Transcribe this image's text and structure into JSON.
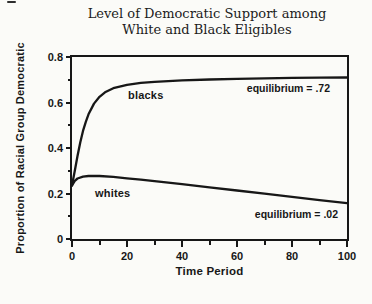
{
  "title": {
    "line1": "Level of Democratic Support among",
    "line2": "White and Black Eligibles"
  },
  "colors": {
    "curve": "#171717",
    "axis": "#171717",
    "background": "#fbfbf8",
    "text": "#171717"
  },
  "chart_data": {
    "type": "line",
    "title": "Level of Democratic Support among White and Black Eligibles",
    "xlabel": "Time Period",
    "ylabel": "Proportion of Racial Group Democratic",
    "xlim": [
      0,
      100
    ],
    "ylim": [
      0,
      0.8
    ],
    "xticks": [
      0,
      20,
      40,
      60,
      80,
      100
    ],
    "xtick_labels": [
      "0",
      "20",
      "40",
      "60",
      "80",
      "100"
    ],
    "xticks_minor": [
      10,
      30,
      50,
      70,
      90
    ],
    "yticks": [
      0,
      0.2,
      0.4,
      0.6,
      0.8
    ],
    "ytick_labels": [
      "0",
      "0.2",
      "0.4",
      "0.6",
      "0.8"
    ],
    "yticks_minor": [
      0.1,
      0.3,
      0.5,
      0.7
    ],
    "grid": false,
    "legend_position": "none",
    "series": [
      {
        "name": "blacks",
        "equilibrium": 0.72,
        "x": [
          0,
          1,
          2,
          3,
          4,
          5,
          6,
          8,
          10,
          12,
          15,
          20,
          25,
          30,
          40,
          50,
          60,
          70,
          80,
          90,
          100
        ],
        "y": [
          0.235,
          0.3,
          0.365,
          0.425,
          0.475,
          0.515,
          0.548,
          0.595,
          0.625,
          0.645,
          0.663,
          0.678,
          0.686,
          0.691,
          0.697,
          0.701,
          0.704,
          0.706,
          0.708,
          0.709,
          0.71
        ]
      },
      {
        "name": "whites",
        "equilibrium": 0.02,
        "x": [
          0,
          1,
          2,
          4,
          6,
          8,
          10,
          15,
          20,
          25,
          30,
          40,
          50,
          60,
          70,
          80,
          90,
          100
        ],
        "y": [
          0.235,
          0.256,
          0.266,
          0.274,
          0.277,
          0.278,
          0.277,
          0.273,
          0.267,
          0.261,
          0.254,
          0.241,
          0.227,
          0.213,
          0.199,
          0.185,
          0.171,
          0.158
        ]
      }
    ],
    "annotations": [
      {
        "text": "blacks",
        "x": 22,
        "y": 0.6
      },
      {
        "text": "whites",
        "x": 10,
        "y": 0.21
      },
      {
        "text": "equilibrium = .72",
        "x": 90,
        "y": 0.655
      },
      {
        "text": "equilibrium = .02",
        "x": 93,
        "y": 0.115
      }
    ]
  }
}
